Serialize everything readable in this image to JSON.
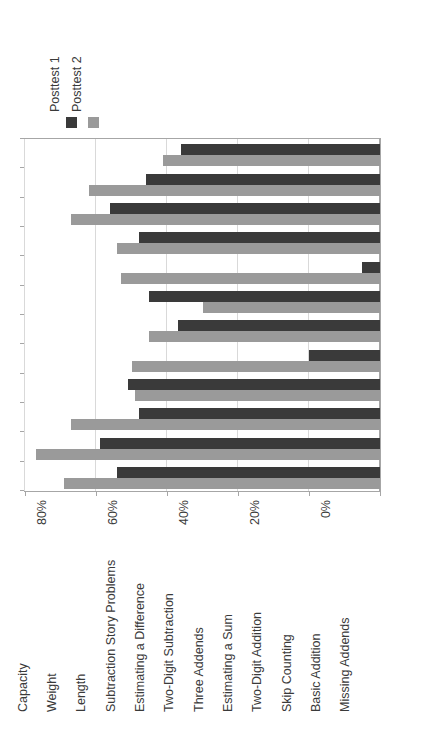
{
  "chart_data": {
    "type": "bar",
    "orientation": "rotated-90",
    "title": "",
    "xlabel": "",
    "ylabel": "",
    "xlim": [
      0,
      100
    ],
    "grid": true,
    "legend_position": "top-left",
    "tick_labels": [
      "0%",
      "20%",
      "40%",
      "60%",
      "80%",
      "100%"
    ],
    "tick_values": [
      0,
      20,
      40,
      60,
      80,
      100
    ],
    "categories": [
      "Capacity",
      "Weight",
      "Length",
      "Subtraction Story Problems",
      "Estimating a Difference",
      "Two-Digit Subtraction",
      "Three Addends",
      "Estimating a Sum",
      "Two-Digit Addition",
      "Skip Counting",
      "Basic Addition",
      "Missing Addends"
    ],
    "series": [
      {
        "name": "Posttest 1",
        "color": "#3a3a3a",
        "values": [
          56,
          66,
          76,
          68,
          5,
          65,
          57,
          20,
          71,
          68,
          79,
          74
        ]
      },
      {
        "name": "Posttest 2",
        "color": "#9a9a9a",
        "values": [
          61,
          82,
          87,
          74,
          73,
          50,
          65,
          70,
          69,
          87,
          97,
          89
        ]
      }
    ]
  },
  "legend": {
    "entries": [
      {
        "label": "Posttest 1",
        "color": "#3a3a3a"
      },
      {
        "label": "Posttest 2",
        "color": "#9a9a9a"
      }
    ]
  },
  "axis": {
    "value_ticks": [
      "0%",
      "20%",
      "40%",
      "60%",
      "80%",
      "100%"
    ]
  }
}
